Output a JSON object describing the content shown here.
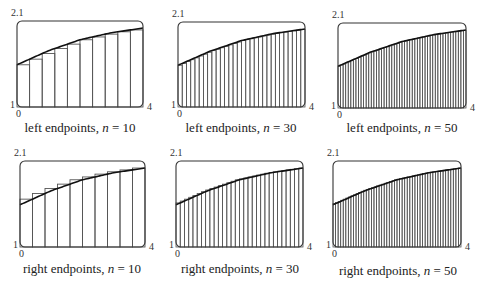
{
  "chart_data": [
    {
      "type": "bar",
      "title": "left endpoints, n = 10",
      "method": "left",
      "n": 10,
      "xlim": [
        0,
        4
      ],
      "ylim": [
        1,
        2.1
      ],
      "tick_labels": {
        "ymax": "2.1",
        "ymin": "1",
        "xmin": "0",
        "xmax": "4"
      },
      "curve": {
        "x": [
          0,
          1,
          2,
          3,
          4
        ],
        "y": [
          1.54,
          1.72,
          1.86,
          1.95,
          2.01
        ]
      },
      "frame": {
        "x": 17,
        "y": 21,
        "w": 126,
        "h": 86
      },
      "caption_pos": [
        80,
        132
      ]
    },
    {
      "type": "bar",
      "title": "left endpoints, n = 30",
      "method": "left",
      "n": 30,
      "xlim": [
        0,
        4
      ],
      "ylim": [
        1,
        2.1
      ],
      "tick_labels": {
        "ymax": "2.1",
        "ymin": "1",
        "xmin": "0",
        "xmax": "4"
      },
      "curve": {
        "x": [
          0,
          1,
          2,
          3,
          4
        ],
        "y": [
          1.54,
          1.72,
          1.86,
          1.95,
          2.01
        ]
      },
      "frame": {
        "x": 178,
        "y": 22,
        "w": 127,
        "h": 85
      },
      "caption_pos": [
        241,
        132
      ]
    },
    {
      "type": "bar",
      "title": "left endpoints, n = 50",
      "method": "left",
      "n": 50,
      "xlim": [
        0,
        4
      ],
      "ylim": [
        1,
        2.1
      ],
      "tick_labels": {
        "ymax": "2.1",
        "ymin": "1",
        "xmin": "0",
        "xmax": "4"
      },
      "curve": {
        "x": [
          0,
          1,
          2,
          3,
          4
        ],
        "y": [
          1.54,
          1.72,
          1.86,
          1.95,
          2.01
        ]
      },
      "frame": {
        "x": 338,
        "y": 23,
        "w": 128,
        "h": 85
      },
      "caption_pos": [
        402,
        132
      ]
    },
    {
      "type": "bar",
      "title": "right endpoints, n = 10",
      "method": "right",
      "n": 10,
      "xlim": [
        0,
        4
      ],
      "ylim": [
        1,
        2.1
      ],
      "tick_labels": {
        "ymax": "2.1",
        "ymin": "1",
        "xmin": "0",
        "xmax": "4"
      },
      "curve": {
        "x": [
          0,
          1,
          2,
          3,
          4
        ],
        "y": [
          1.54,
          1.72,
          1.86,
          1.95,
          2.01
        ]
      },
      "frame": {
        "x": 20,
        "y": 161,
        "w": 125,
        "h": 86
      },
      "caption_pos": [
        82,
        273
      ]
    },
    {
      "type": "bar",
      "title": "right endpoints, n = 30",
      "method": "right",
      "n": 30,
      "xlim": [
        0,
        4
      ],
      "ylim": [
        1,
        2.1
      ],
      "tick_labels": {
        "ymax": "2.1",
        "ymin": "1",
        "xmin": "0",
        "xmax": "4"
      },
      "curve": {
        "x": [
          0,
          1,
          2,
          3,
          4
        ],
        "y": [
          1.54,
          1.72,
          1.86,
          1.95,
          2.01
        ]
      },
      "frame": {
        "x": 176,
        "y": 161,
        "w": 127,
        "h": 86
      },
      "caption_pos": [
        240,
        273
      ]
    },
    {
      "type": "bar",
      "title": "right endpoints, n = 50",
      "method": "right",
      "n": 50,
      "xlim": [
        0,
        4
      ],
      "ylim": [
        1,
        2.1
      ],
      "tick_labels": {
        "ymax": "2.1",
        "ymin": "1",
        "xmin": "0",
        "xmax": "4"
      },
      "curve": {
        "x": [
          0,
          1,
          2,
          3,
          4
        ],
        "y": [
          1.54,
          1.72,
          1.86,
          1.95,
          2.01
        ]
      },
      "frame": {
        "x": 333,
        "y": 161,
        "w": 128,
        "h": 86
      },
      "caption_pos": [
        398,
        275
      ]
    }
  ],
  "style": {
    "frame_color": "#333333",
    "bar_color": "#555555",
    "curve_color": "#111111"
  }
}
